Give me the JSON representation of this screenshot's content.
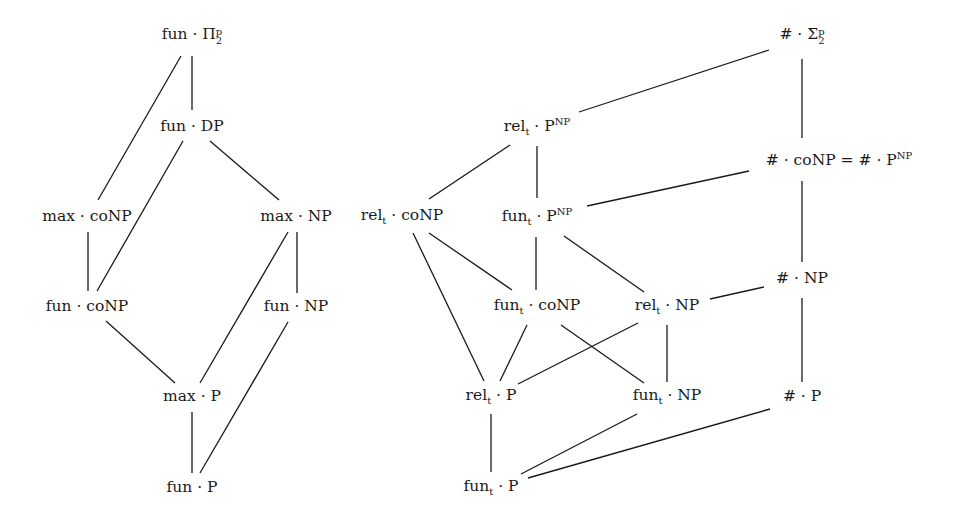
{
  "diagram": {
    "type": "hasse-diagram",
    "nodes": [
      {
        "id": "fun_Pi2p",
        "x": 192,
        "y": 36,
        "base": "fun",
        "op": "·",
        "class": "Π",
        "sub": "2",
        "sup": "p"
      },
      {
        "id": "fun_DP",
        "x": 192,
        "y": 127,
        "base": "fun",
        "op": "·",
        "class": "DP"
      },
      {
        "id": "max_coNP",
        "x": 87,
        "y": 217,
        "base": "max",
        "op": "·",
        "class": "coNP"
      },
      {
        "id": "max_NP",
        "x": 296,
        "y": 217,
        "base": "max",
        "op": "·",
        "class": "NP"
      },
      {
        "id": "fun_coNP",
        "x": 87,
        "y": 307,
        "base": "fun",
        "op": "·",
        "class": "coNP"
      },
      {
        "id": "fun_NP",
        "x": 296,
        "y": 307,
        "base": "fun",
        "op": "·",
        "class": "NP"
      },
      {
        "id": "max_P",
        "x": 192,
        "y": 397,
        "base": "max",
        "op": "·",
        "class": "P"
      },
      {
        "id": "fun_P",
        "x": 192,
        "y": 488,
        "base": "fun",
        "op": "·",
        "class": "P"
      },
      {
        "id": "relt_PNP",
        "x": 537,
        "y": 127,
        "base": "rel",
        "base_sub": "t",
        "op": "·",
        "class": "P",
        "class_sup": "NP"
      },
      {
        "id": "relt_coNP",
        "x": 402,
        "y": 217,
        "base": "rel",
        "base_sub": "t",
        "op": "·",
        "class": "coNP"
      },
      {
        "id": "funt_PNP",
        "x": 537,
        "y": 217,
        "base": "fun",
        "base_sub": "t",
        "op": "·",
        "class": "P",
        "class_sup": "NP"
      },
      {
        "id": "funt_coNP",
        "x": 537,
        "y": 307,
        "base": "fun",
        "base_sub": "t",
        "op": "·",
        "class": "coNP"
      },
      {
        "id": "relt_NP",
        "x": 667,
        "y": 307,
        "base": "rel",
        "base_sub": "t",
        "op": "·",
        "class": "NP"
      },
      {
        "id": "relt_P",
        "x": 491,
        "y": 397,
        "base": "rel",
        "base_sub": "t",
        "op": "·",
        "class": "P"
      },
      {
        "id": "funt_NP",
        "x": 667,
        "y": 397,
        "base": "fun",
        "base_sub": "t",
        "op": "·",
        "class": "NP"
      },
      {
        "id": "funt_P",
        "x": 491,
        "y": 488,
        "base": "fun",
        "base_sub": "t",
        "op": "·",
        "class": "P"
      },
      {
        "id": "sharp_Sigma2p",
        "x": 802,
        "y": 36,
        "base": "#",
        "op": "·",
        "class": "Σ",
        "sub": "2",
        "sup": "p"
      },
      {
        "id": "sharp_coNP_eq",
        "x": 839,
        "y": 160,
        "base": "#",
        "op": "·",
        "class": "coNP",
        "eq": "= # · P",
        "eq_sup": "NP"
      },
      {
        "id": "sharp_NP",
        "x": 802,
        "y": 279,
        "base": "#",
        "op": "·",
        "class": "NP"
      },
      {
        "id": "sharp_P",
        "x": 802,
        "y": 397,
        "base": "#",
        "op": "·",
        "class": "P"
      }
    ],
    "edges": [
      {
        "from": "fun_Pi2p",
        "to": "fun_DP",
        "x1": 192,
        "y1": 56,
        "x2": 192,
        "y2": 110
      },
      {
        "from": "fun_Pi2p",
        "to": "max_coNP",
        "x1": 181,
        "y1": 56,
        "x2": 98,
        "y2": 200
      },
      {
        "from": "fun_DP",
        "to": "max_NP",
        "x1": 210,
        "y1": 141,
        "x2": 279,
        "y2": 200
      },
      {
        "from": "fun_DP",
        "to": "fun_coNP",
        "x1": 183,
        "y1": 141,
        "x2": 97,
        "y2": 291
      },
      {
        "from": "max_coNP",
        "to": "fun_coNP",
        "x1": 88,
        "y1": 232,
        "x2": 88,
        "y2": 291
      },
      {
        "from": "max_NP",
        "to": "fun_NP",
        "x1": 297,
        "y1": 232,
        "x2": 297,
        "y2": 293
      },
      {
        "from": "max_NP",
        "to": "max_P",
        "x1": 288,
        "y1": 232,
        "x2": 200,
        "y2": 383
      },
      {
        "from": "fun_coNP",
        "to": "max_P",
        "x1": 106,
        "y1": 321,
        "x2": 175,
        "y2": 383
      },
      {
        "from": "fun_NP",
        "to": "fun_P",
        "x1": 288,
        "y1": 322,
        "x2": 200,
        "y2": 473
      },
      {
        "from": "max_P",
        "to": "fun_P",
        "x1": 192,
        "y1": 412,
        "x2": 192,
        "y2": 473
      },
      {
        "from": "relt_PNP",
        "to": "sharp_Sigma2p",
        "x1": 579,
        "y1": 112,
        "x2": 769,
        "y2": 50
      },
      {
        "from": "relt_PNP",
        "to": "relt_coNP",
        "x1": 510,
        "y1": 145,
        "x2": 429,
        "y2": 199
      },
      {
        "from": "relt_PNP",
        "to": "funt_PNP",
        "x1": 537,
        "y1": 146,
        "x2": 537,
        "y2": 198
      },
      {
        "from": "funt_PNP",
        "to": "sharp_coNP_eq",
        "x1": 587,
        "y1": 206,
        "x2": 749,
        "y2": 171
      },
      {
        "from": "funt_PNP",
        "to": "funt_coNP",
        "x1": 536,
        "y1": 237,
        "x2": 536,
        "y2": 290
      },
      {
        "from": "funt_PNP",
        "to": "relt_NP",
        "x1": 564,
        "y1": 236,
        "x2": 644,
        "y2": 292
      },
      {
        "from": "relt_coNP",
        "to": "funt_coNP",
        "x1": 429,
        "y1": 233,
        "x2": 512,
        "y2": 290
      },
      {
        "from": "relt_coNP",
        "to": "relt_P",
        "x1": 413,
        "y1": 233,
        "x2": 484,
        "y2": 381
      },
      {
        "from": "funt_coNP",
        "to": "relt_P",
        "x1": 527,
        "y1": 325,
        "x2": 500,
        "y2": 381
      },
      {
        "from": "funt_coNP",
        "to": "funt_NP",
        "x1": 561,
        "y1": 325,
        "x2": 644,
        "y2": 383
      },
      {
        "from": "relt_NP",
        "to": "relt_P",
        "x1": 638,
        "y1": 323,
        "x2": 518,
        "y2": 384
      },
      {
        "from": "relt_NP",
        "to": "funt_NP",
        "x1": 667,
        "y1": 325,
        "x2": 667,
        "y2": 382
      },
      {
        "from": "relt_NP",
        "to": "sharp_NP",
        "x1": 710,
        "y1": 299,
        "x2": 764,
        "y2": 287
      },
      {
        "from": "relt_P",
        "to": "funt_P",
        "x1": 491,
        "y1": 414,
        "x2": 491,
        "y2": 472
      },
      {
        "from": "funt_NP",
        "to": "funt_P",
        "x1": 637,
        "y1": 414,
        "x2": 521,
        "y2": 474
      },
      {
        "from": "sharp_P",
        "to": "funt_P",
        "x1": 770,
        "y1": 409,
        "x2": 528,
        "y2": 478
      },
      {
        "from": "sharp_Sigma2p",
        "to": "sharp_coNP_eq",
        "x1": 802,
        "y1": 59,
        "x2": 802,
        "y2": 138
      },
      {
        "from": "sharp_coNP_eq",
        "to": "sharp_NP",
        "x1": 802,
        "y1": 181,
        "x2": 802,
        "y2": 262
      },
      {
        "from": "sharp_NP",
        "to": "sharp_P",
        "x1": 802,
        "y1": 298,
        "x2": 802,
        "y2": 382
      }
    ]
  },
  "colors": {
    "ink": "#1a1a1a",
    "background": "#ffffff"
  }
}
